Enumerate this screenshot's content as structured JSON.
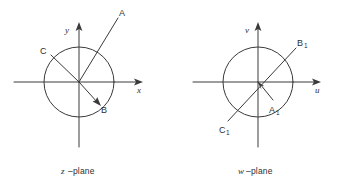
{
  "figure": {
    "type": "diagram",
    "stroke_color": "#3a3a3a",
    "background_color": "#ffffff",
    "panels": [
      {
        "id": "z-plane",
        "caption_variable": "z",
        "caption_suffix": "–plane",
        "center": {
          "x": 79,
          "y": 82
        },
        "radius": 35,
        "axes": [
          {
            "name": "x-axis",
            "label": "x",
            "direction": "horizontal",
            "arrow": "right"
          },
          {
            "name": "y-axis",
            "label": "y",
            "direction": "vertical",
            "arrow": "up"
          }
        ],
        "rays": [
          {
            "name": "ray-A",
            "label": "A",
            "from_origin": true,
            "end": {
              "x": 118,
              "y": 18
            },
            "arrow_at_end": false,
            "label_pos": {
              "x": 121,
              "y": 15
            }
          },
          {
            "name": "ray-B",
            "label": "B",
            "from_origin": true,
            "end": {
              "x": 99,
              "y": 104
            },
            "arrow_at_end": true,
            "label_pos": {
              "x": 101,
              "y": 111
            }
          },
          {
            "name": "ray-C",
            "label": "C",
            "from_origin": true,
            "end": {
              "x": 50,
              "y": 54
            },
            "arrow_at_end": false,
            "label_pos": {
              "x": 44,
              "y": 52
            }
          }
        ]
      },
      {
        "id": "w-plane",
        "caption_variable": "w",
        "caption_suffix": "–plane",
        "center": {
          "x": 258,
          "y": 82
        },
        "radius": 35,
        "axes": [
          {
            "name": "u-axis",
            "label": "u",
            "direction": "horizontal",
            "arrow": "right"
          },
          {
            "name": "v-axis",
            "label": "v",
            "direction": "vertical",
            "arrow": "up"
          }
        ],
        "rays": [
          {
            "name": "ray-A1",
            "label": "A",
            "subscript": "1",
            "from_origin": true,
            "end": {
              "x": 274,
              "y": 101
            },
            "arrow_at_origin": true,
            "label_pos": {
              "x": 271,
              "y": 112
            }
          },
          {
            "name": "ray-B1",
            "label": "B",
            "subscript": "1",
            "from_origin": true,
            "end": {
              "x": 296,
              "y": 48
            },
            "arrow_at_end": false,
            "label_pos": {
              "x": 299,
              "y": 45
            }
          },
          {
            "name": "ray-C1",
            "label": "C",
            "subscript": "1",
            "from_origin": true,
            "end": {
              "x": 228,
              "y": 121
            },
            "arrow_at_end": false,
            "label_pos": {
              "x": 222,
              "y": 133
            }
          }
        ]
      }
    ]
  }
}
